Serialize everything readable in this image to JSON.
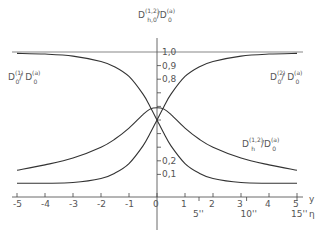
{
  "chart_data": {
    "type": "line",
    "title": "",
    "xlabel": "y",
    "x2label": "η",
    "ylabel": "D_h,0^(1,2) / D_0^(a)",
    "xlim": [
      -5,
      5
    ],
    "ylim": [
      0,
      1.0
    ],
    "grid": false,
    "x_ticks": [
      "-5",
      "-4",
      "-3",
      "-2",
      "-1",
      "0",
      "1",
      "2",
      "3",
      "4",
      "5"
    ],
    "x2_ticks": [
      "5''",
      "10''",
      "15''"
    ],
    "y_ticks": [
      "0,1",
      "0,2",
      "0,8",
      "0,9",
      "1,0"
    ],
    "reference_line": {
      "y": 1.0,
      "label": "1,0"
    },
    "x": [
      -5,
      -4,
      -3,
      -2,
      -1.5,
      -1,
      -0.5,
      -0.25,
      0,
      0.25,
      0.5,
      1,
      1.5,
      2,
      3,
      4,
      5
    ],
    "series": [
      {
        "name": "D_0^(1)/D_0^(a)",
        "values": [
          0.99,
          0.985,
          0.97,
          0.93,
          0.89,
          0.82,
          0.69,
          0.6,
          0.5,
          0.4,
          0.31,
          0.18,
          0.11,
          0.07,
          0.04,
          0.035,
          0.035
        ]
      },
      {
        "name": "D_0^(2)/D_0^(a)",
        "values": [
          0.035,
          0.035,
          0.04,
          0.07,
          0.11,
          0.18,
          0.31,
          0.4,
          0.5,
          0.6,
          0.69,
          0.82,
          0.89,
          0.93,
          0.97,
          0.985,
          0.99
        ]
      },
      {
        "name": "D_h^(1,2)/D_0^(a)",
        "values": [
          0.13,
          0.17,
          0.22,
          0.3,
          0.36,
          0.44,
          0.54,
          0.58,
          0.59,
          0.58,
          0.54,
          0.44,
          0.36,
          0.3,
          0.22,
          0.17,
          0.13
        ]
      }
    ]
  },
  "labels": {
    "y_axis_title_main": "D",
    "y_axis_title_sup1": "(1,2)",
    "y_axis_title_sub1": "h,0",
    "y_axis_title_slash": "/D",
    "y_axis_title_sup2": "(a)",
    "y_axis_title_sub2": "0",
    "left_curve_main": "D",
    "left_curve_sup1": "(1)",
    "left_curve_sub1": "0",
    "left_curve_slash": "/ D",
    "left_curve_sup2": "(a)",
    "left_curve_sub2": "0",
    "right_curve_main": "D",
    "right_curve_sup1": "(2)",
    "right_curve_sub1": "0",
    "right_curve_slash": "/ D",
    "right_curve_sup2": "(a)",
    "right_curve_sub2": "0",
    "hump_curve_main": "D",
    "hump_curve_sup1": "(1,2)",
    "hump_curve_sub1": "h",
    "hump_curve_slash": "/D",
    "hump_curve_sup2": "(a)",
    "hump_curve_sub2": "0"
  }
}
